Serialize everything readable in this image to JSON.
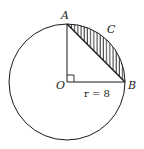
{
  "diagram": {
    "labels": {
      "A": "A",
      "B": "B",
      "C": "C",
      "O": "O",
      "radius": "r = 8"
    },
    "colors": {
      "stroke": "#1a1a1a",
      "background": "#ffffff"
    }
  }
}
